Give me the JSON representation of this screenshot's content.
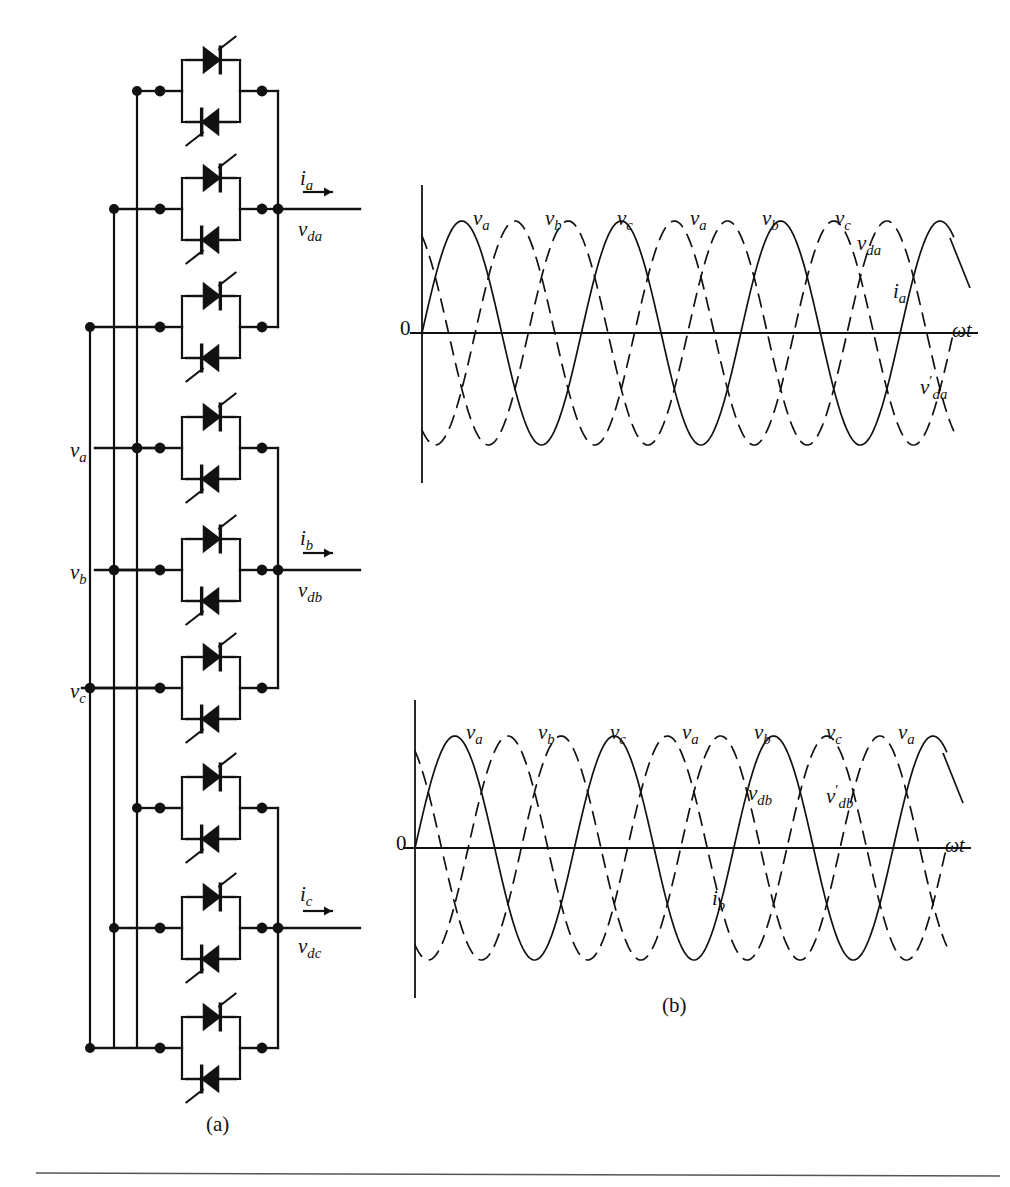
{
  "figure": {
    "type": "two-panel-technical-figure",
    "panel_a_caption": "(a)",
    "panel_b_caption": "(b)"
  },
  "circuit": {
    "name": "three-phase-cycloconverter",
    "input_labels": [
      {
        "id": "va",
        "text": "v",
        "sub": "a",
        "x": 70,
        "y": 440
      },
      {
        "id": "vb",
        "text": "v",
        "sub": "b",
        "x": 70,
        "y": 562
      },
      {
        "id": "vc",
        "text": "v",
        "sub": "c",
        "x": 70,
        "y": 681
      }
    ],
    "output_groups": [
      {
        "id": "phase-a-output",
        "current": {
          "text": "i",
          "sub": "a",
          "x": 300,
          "y": 168
        },
        "voltage": {
          "text": "v",
          "sub": "da",
          "x": 298,
          "y": 219
        },
        "arrow_y": 192
      },
      {
        "id": "phase-b-output",
        "current": {
          "text": "i",
          "sub": "b",
          "x": 300,
          "y": 528
        },
        "voltage": {
          "text": "v",
          "sub": "db",
          "x": 298,
          "y": 580
        },
        "arrow_y": 552
      },
      {
        "id": "phase-c-output",
        "current": {
          "text": "i",
          "sub": "c",
          "x": 300,
          "y": 884
        },
        "voltage": {
          "text": "v",
          "sub": "dc",
          "x": 298,
          "y": 936
        },
        "arrow_y": 908
      }
    ],
    "thyristor_block_count": 9,
    "thyristors_per_block": 2,
    "block_arrangement": "anti-parallel pair",
    "group_count": 3,
    "blocks_per_group": 3
  },
  "chart_data": [
    {
      "id": "waveform-panel-top",
      "type": "line",
      "title": "",
      "xlabel": "ωt",
      "ylabel": "",
      "xlim": [
        0,
        6.6
      ],
      "ylim": [
        -1.25,
        1.25
      ],
      "grid": false,
      "zero_label": "0",
      "axis_label_x": "ωt",
      "series": [
        {
          "name": "v_a",
          "style": "solid",
          "phase_deg": 0,
          "amplitude": 1.0
        },
        {
          "name": "v_b",
          "style": "dashed",
          "phase_deg": -120,
          "amplitude": 1.0
        },
        {
          "name": "v_c",
          "style": "dashed",
          "phase_deg": -240,
          "amplitude": 1.0
        }
      ],
      "annotations": [
        {
          "text": "v",
          "sub": "a",
          "x": 473,
          "y": 208
        },
        {
          "text": "v",
          "sub": "b",
          "x": 545,
          "y": 208
        },
        {
          "text": "v",
          "sub": "c",
          "x": 617,
          "y": 208
        },
        {
          "text": "v",
          "sub": "a",
          "x": 690,
          "y": 208
        },
        {
          "text": "v",
          "sub": "b",
          "x": 762,
          "y": 208
        },
        {
          "text": "v",
          "sub": "c",
          "x": 835,
          "y": 208
        },
        {
          "text": "v",
          "sub": "da",
          "x": 857,
          "y": 233
        },
        {
          "text": "i",
          "sub": "a",
          "x": 893,
          "y": 281
        },
        {
          "text": "v",
          "sub": "da",
          "prime": true,
          "x": 920,
          "y": 374
        }
      ]
    },
    {
      "id": "waveform-panel-bottom",
      "type": "line",
      "title": "",
      "xlabel": "ωt",
      "ylabel": "",
      "xlim": [
        0,
        6.6
      ],
      "ylim": [
        -1.25,
        1.25
      ],
      "grid": false,
      "zero_label": "0",
      "axis_label_x": "ωt",
      "series": [
        {
          "name": "v_a",
          "style": "solid",
          "phase_deg": 0,
          "amplitude": 1.0
        },
        {
          "name": "v_b",
          "style": "dashed",
          "phase_deg": -120,
          "amplitude": 1.0
        },
        {
          "name": "v_c",
          "style": "dashed",
          "phase_deg": -240,
          "amplitude": 1.0
        }
      ],
      "annotations": [
        {
          "text": "v",
          "sub": "a",
          "x": 466,
          "y": 722
        },
        {
          "text": "v",
          "sub": "b",
          "x": 538,
          "y": 722
        },
        {
          "text": "v",
          "sub": "c",
          "x": 610,
          "y": 722
        },
        {
          "text": "v",
          "sub": "a",
          "x": 682,
          "y": 722
        },
        {
          "text": "v",
          "sub": "b",
          "x": 754,
          "y": 722
        },
        {
          "text": "v",
          "sub": "c",
          "x": 826,
          "y": 722
        },
        {
          "text": "v",
          "sub": "a",
          "x": 898,
          "y": 722
        },
        {
          "text": "v",
          "sub": "db",
          "x": 748,
          "y": 783
        },
        {
          "text": "v",
          "sub": "db",
          "prime": true,
          "x": 826,
          "y": 783
        },
        {
          "text": "i",
          "sub": "b",
          "x": 712,
          "y": 888
        }
      ]
    }
  ],
  "colors": {
    "ink": "#111111",
    "paper": "#ffffff",
    "rule": "#555555"
  }
}
